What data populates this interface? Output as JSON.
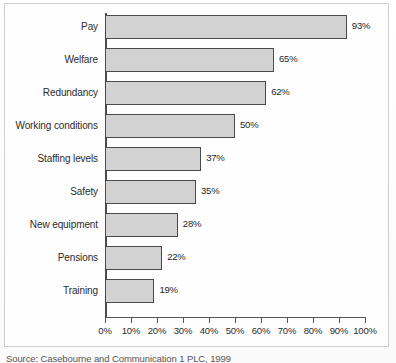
{
  "chart_data": {
    "type": "bar",
    "orientation": "horizontal",
    "title": "",
    "xlabel": "",
    "ylabel": "",
    "categories": [
      "Pay",
      "Welfare",
      "Redundancy",
      "Working conditions",
      "Staffing levels",
      "Safety",
      "New equipment",
      "Pensions",
      "Training"
    ],
    "values": [
      93,
      65,
      62,
      50,
      37,
      35,
      28,
      22,
      19
    ],
    "value_labels": [
      "93%",
      "65%",
      "62%",
      "50%",
      "37%",
      "35%",
      "28%",
      "22%",
      "19%"
    ],
    "xlim": [
      0,
      100
    ],
    "x_tick_labels": [
      "0%",
      "10%",
      "20%",
      "30%",
      "40%",
      "50%",
      "60%",
      "70%",
      "80%",
      "90%",
      "100%"
    ],
    "x_ticks": [
      0,
      10,
      20,
      30,
      40,
      50,
      60,
      70,
      80,
      90,
      100
    ],
    "grid": false,
    "legend": null,
    "bar_fill_color": "#d2d2d2",
    "bar_border_color": "#4a4a4a",
    "axis_color": "#555555"
  },
  "caption": "Source: Casebourne and Communication 1 PLC, 1999"
}
